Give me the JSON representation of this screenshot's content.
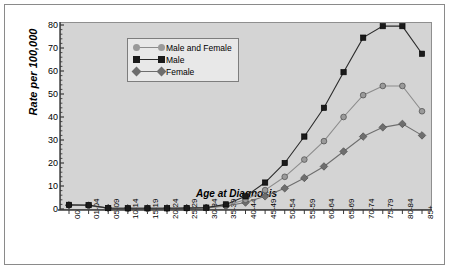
{
  "chart_data": {
    "type": "line",
    "title": "",
    "xlabel": "Age at Diagnosis",
    "ylabel": "Rate per 100,000",
    "ylim": [
      0,
      80
    ],
    "yticks": [
      0,
      10,
      20,
      30,
      40,
      50,
      60,
      70,
      80
    ],
    "grid": false,
    "legend_position": "top-center",
    "categories": [
      "00",
      "01-04",
      "05-09",
      "10-14",
      "15-19",
      "20-24",
      "25-29",
      "30-34",
      "35-39",
      "40-44",
      "45-49",
      "50-54",
      "55-59",
      "60-64",
      "65-69",
      "70-74",
      "75-79",
      "80-84",
      "85+"
    ],
    "series": [
      {
        "name": "Male and Female",
        "marker": "circle",
        "color": "#9a9a9a",
        "line_color": "#8c8c8c",
        "values": [
          1.7,
          1.6,
          0.4,
          0.3,
          0.3,
          0.3,
          0.4,
          0.5,
          1.6,
          4.0,
          8.2,
          14.0,
          21.5,
          29.5,
          40.0,
          49.5,
          53.5,
          53.5,
          42.5
        ]
      },
      {
        "name": "Male",
        "marker": "square",
        "color": "#1a1a1a",
        "line_color": "#2b2b2b",
        "values": [
          1.8,
          1.7,
          0.4,
          0.3,
          0.3,
          0.3,
          0.4,
          0.6,
          2.0,
          5.5,
          11.5,
          20.0,
          31.5,
          44.0,
          59.5,
          74.5,
          79.5,
          79.5,
          67.5
        ]
      },
      {
        "name": "Female",
        "marker": "diamond",
        "color": "#6e6e6e",
        "line_color": "#6e6e6e",
        "values": [
          1.6,
          1.5,
          0.4,
          0.3,
          0.3,
          0.3,
          0.4,
          0.5,
          1.3,
          2.8,
          5.5,
          9.0,
          13.5,
          18.5,
          25.0,
          31.5,
          35.5,
          37.0,
          32.0
        ]
      }
    ]
  },
  "legend": {
    "items": [
      {
        "label": "Male and Female"
      },
      {
        "label": "Male"
      },
      {
        "label": "Female"
      }
    ]
  },
  "colors": {
    "panel_background": "#d4d4d4",
    "figure_background": "#ffffff",
    "axis": "#3a3a3a",
    "male": "#1a1a1a",
    "male_and_female": "#9a9a9a",
    "female": "#6e6e6e"
  }
}
